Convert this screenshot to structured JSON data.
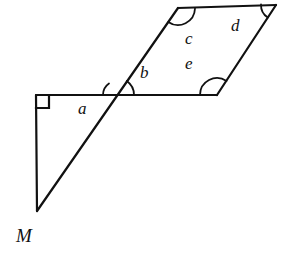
{
  "figure": {
    "type": "geometry-diagram",
    "stroke_color": "#111111",
    "background_color": "#ffffff",
    "stroke_width": 2.2,
    "labels": [
      {
        "id": "a",
        "text": "a",
        "x": 78,
        "y": 100,
        "italic": true
      },
      {
        "id": "b",
        "text": "b",
        "x": 140,
        "y": 64,
        "italic": true
      },
      {
        "id": "c",
        "text": "c",
        "x": 185,
        "y": 30,
        "italic": true
      },
      {
        "id": "e",
        "text": "e",
        "x": 185,
        "y": 55,
        "italic": true
      },
      {
        "id": "d",
        "text": "d",
        "x": 231,
        "y": 17,
        "italic": true
      },
      {
        "id": "M",
        "text": "M",
        "x": 16,
        "y": 226,
        "italic": true
      }
    ],
    "points": {
      "right_angle_corner": {
        "x": 36,
        "y": 95
      },
      "triangle_apex_M": {
        "x": 37,
        "y": 211
      },
      "horizontal_end": {
        "x": 217,
        "y": 95
      },
      "intersection": {
        "x": 117,
        "y": 95
      },
      "para_top_left": {
        "x": 178,
        "y": 8
      },
      "para_top_right": {
        "x": 276,
        "y": 5
      },
      "para_bottom_right": {
        "x": 217,
        "y": 95
      },
      "para_bottom_left": {
        "x": 117,
        "y": 95
      }
    },
    "segments": [
      {
        "id": "vertical-leg",
        "x1": 36,
        "y1": 95,
        "x2": 37,
        "y2": 211
      },
      {
        "id": "horizontal-base",
        "x1": 36,
        "y1": 95,
        "x2": 217,
        "y2": 95
      },
      {
        "id": "transversal",
        "x1": 37,
        "y1": 211,
        "x2": 178,
        "y2": 8
      },
      {
        "id": "parallelogram-top",
        "x1": 178,
        "y1": 8,
        "x2": 276,
        "y2": 5
      },
      {
        "id": "parallelogram-right",
        "x1": 276,
        "y1": 5,
        "x2": 217,
        "y2": 95
      }
    ],
    "right_angle_marker": {
      "x": 36,
      "y": 95,
      "size": 13
    },
    "angle_arcs": [
      {
        "id": "arc-a",
        "cx": 117,
        "cy": 95,
        "r": 14,
        "start_deg": 180,
        "end_deg": 235
      },
      {
        "id": "arc-b",
        "cx": 117,
        "cy": 95,
        "r": 17,
        "start_deg": 305,
        "end_deg": 360
      },
      {
        "id": "arc-c",
        "cx": 178,
        "cy": 8,
        "r": 17,
        "start_deg": 2,
        "end_deg": 125
      },
      {
        "id": "arc-d",
        "cx": 276,
        "cy": 5,
        "r": 15,
        "start_deg": 123,
        "end_deg": 182
      },
      {
        "id": "arc-e",
        "cx": 217,
        "cy": 95,
        "r": 17,
        "start_deg": 180,
        "end_deg": 304
      }
    ]
  }
}
